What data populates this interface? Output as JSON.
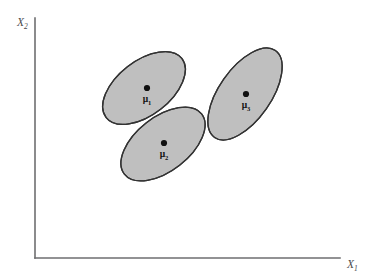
{
  "figure": {
    "title": "",
    "background_color": "#ffffff",
    "width": 365,
    "height": 280
  },
  "axes": {
    "line_color": "#6e6e70",
    "origin": {
      "x": 35,
      "y": 258
    },
    "x_axis": {
      "label_base": "X",
      "label_sub": "1",
      "label_x": 347,
      "label_y": 268,
      "start_x": 35,
      "end_x": 340,
      "y": 258
    },
    "y_axis": {
      "label_base": "X",
      "label_sub": "2",
      "label_x": 17,
      "label_y": 26,
      "start_y": 18,
      "end_y": 258,
      "x": 35
    }
  },
  "chart_data": {
    "type": "scatter",
    "title": "",
    "xlabel": "X1",
    "ylabel": "X2",
    "grid": false,
    "legend": "none",
    "fill_color": "#bfbfbf",
    "stroke_color": "#333333",
    "dot_color": "#101010",
    "ellipses": [
      {
        "name": "cluster-1",
        "label_base": "μ",
        "label_sub": "1",
        "cx": 144,
        "cy": 88,
        "rx": 48,
        "ry": 27,
        "rotation": -38,
        "dot_x": 147,
        "dot_y": 88,
        "dot_r": 3.1,
        "label_x": 147,
        "label_y": 102
      },
      {
        "name": "cluster-2",
        "label_base": "μ",
        "label_sub": "2",
        "cx": 163,
        "cy": 144,
        "rx": 49,
        "ry": 27,
        "rotation": -38,
        "dot_x": 164,
        "dot_y": 143,
        "dot_r": 3.1,
        "label_x": 164,
        "label_y": 157
      },
      {
        "name": "cluster-3",
        "label_base": "μ",
        "label_sub": "3",
        "cx": 245,
        "cy": 94,
        "rx": 53,
        "ry": 26,
        "rotation": -55,
        "dot_x": 246,
        "dot_y": 94,
        "dot_r": 3.1,
        "label_x": 246,
        "label_y": 108
      }
    ]
  }
}
